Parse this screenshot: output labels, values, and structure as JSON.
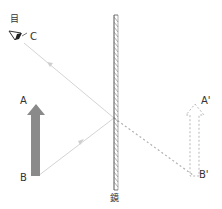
{
  "labels": {
    "eye": "目",
    "eye_point": "C",
    "object_top": "A",
    "object_bottom": "B",
    "image_top": "A'",
    "image_bottom": "B'",
    "mirror": "鏡"
  },
  "colors": {
    "object_arrow": "#8a8a8a",
    "ray": "#d0d0d0",
    "dashed": "#b0b0b0",
    "mirror": "#555555",
    "text": "#333333"
  },
  "geometry": {
    "mirror": {
      "x": 116,
      "y1": 15,
      "y2": 190
    },
    "reflection_point": {
      "x": 114,
      "y": 118
    },
    "eye": {
      "x": 20,
      "y": 40
    },
    "object": {
      "top": {
        "x": 36,
        "y": 104
      },
      "bottom": {
        "x": 36,
        "y": 176
      }
    },
    "image": {
      "top": {
        "x": 195,
        "y": 104
      },
      "bottom": {
        "x": 195,
        "y": 176
      }
    }
  }
}
